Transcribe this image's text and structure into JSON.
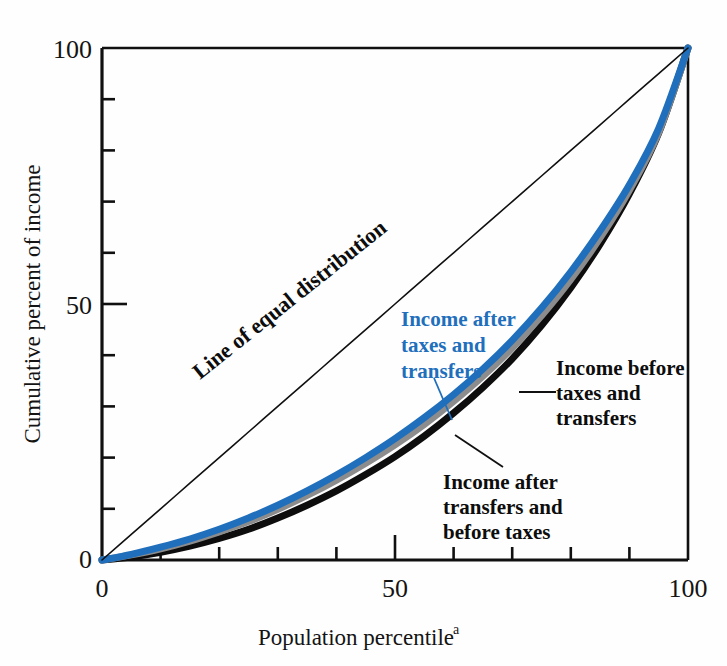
{
  "figure": {
    "background_color": "#fefefe",
    "frame_color": "#101010"
  },
  "chart_data": {
    "type": "line",
    "title": "",
    "subtitle": "",
    "xlabel": "Population percentile",
    "xlabel_superscript": "a",
    "ylabel": "Cumulative percent of income",
    "xlim": [
      0,
      100
    ],
    "ylim": [
      0,
      100
    ],
    "grid": false,
    "legend_position": "inline-annotations",
    "x_tick_labels": [
      "0",
      "50",
      "100"
    ],
    "x_tick_label_values": [
      0,
      50,
      100
    ],
    "y_tick_labels": [
      "0",
      "50",
      "100"
    ],
    "y_tick_label_values": [
      0,
      50,
      100
    ],
    "minor_tick_interval": 10,
    "x": [
      0,
      5,
      10,
      15,
      20,
      25,
      30,
      35,
      40,
      45,
      50,
      55,
      60,
      65,
      70,
      75,
      80,
      85,
      90,
      95,
      100
    ],
    "series": [
      {
        "name": "Line of equal distribution",
        "color": "#101010",
        "width": 1.6,
        "values": [
          0,
          5,
          10,
          15,
          20,
          25,
          30,
          35,
          40,
          45,
          50,
          55,
          60,
          65,
          70,
          75,
          80,
          85,
          90,
          95,
          100
        ]
      },
      {
        "name": "Income after taxes and transfers",
        "color": "#1f6fbc",
        "width": 7,
        "values": [
          0,
          1.1,
          2.5,
          4.1,
          6.0,
          8.2,
          10.7,
          13.5,
          16.6,
          20.0,
          23.7,
          27.8,
          32.3,
          37.3,
          42.9,
          49.2,
          56.3,
          64.3,
          73.3,
          84.3,
          100
        ]
      },
      {
        "name": "Income after transfers and before taxes",
        "color": "#8c8c8c",
        "width": 7,
        "values": [
          0,
          1.0,
          2.2,
          3.7,
          5.5,
          7.5,
          9.9,
          12.6,
          15.6,
          18.9,
          22.5,
          26.5,
          31.0,
          35.9,
          41.4,
          47.7,
          54.8,
          62.9,
          72.2,
          83.5,
          100
        ]
      },
      {
        "name": "Income before taxes and transfers",
        "color": "#0d0d0d",
        "width": 7,
        "values": [
          0,
          0.6,
          1.5,
          2.7,
          4.2,
          6.0,
          8.2,
          10.7,
          13.5,
          16.7,
          20.2,
          24.2,
          28.7,
          33.7,
          39.3,
          45.8,
          53.2,
          61.7,
          71.5,
          83.4,
          100
        ]
      }
    ],
    "annotations": [
      {
        "id": "line-of-equal-distribution",
        "text": "Line of equal distribution",
        "color": "#0d0d0d",
        "rotation": -38,
        "bold": true
      },
      {
        "id": "income-after-taxes-and-transfers",
        "lines": [
          "Income after",
          "taxes and",
          "transfers"
        ],
        "color": "#1f6fbc",
        "bold": true,
        "leader": true
      },
      {
        "id": "income-before-taxes-and-transfers",
        "lines": [
          "Income before",
          "taxes and",
          "transfers"
        ],
        "color": "#0d0d0d",
        "bold": true,
        "leader": true
      },
      {
        "id": "income-after-transfers-and-before-taxes",
        "lines": [
          "Income after",
          "transfers and",
          "before taxes"
        ],
        "color": "#0d0d0d",
        "bold": true,
        "leader": true
      }
    ]
  }
}
